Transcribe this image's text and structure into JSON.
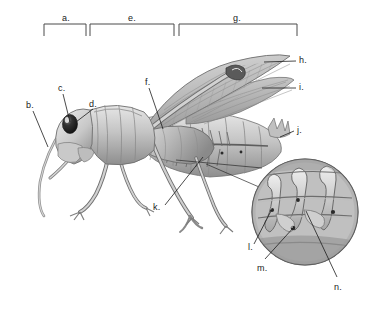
{
  "figure": {
    "background_color": "#ffffff",
    "ink_color": "#1a1a1a",
    "body_fill_light": "#d8d8d8",
    "body_fill_mid": "#b0b0b0",
    "body_fill_dark": "#7a7a7a",
    "body_fill_darkest": "#4a4a4a"
  },
  "brackets": [
    {
      "id": "bracket-a",
      "label": "a.",
      "x1": 44,
      "x2": 86,
      "label_x": 62,
      "label_y": 14
    },
    {
      "id": "bracket-e",
      "label": "e.",
      "x1": 90,
      "x2": 174,
      "label_x": 128,
      "label_y": 14
    },
    {
      "id": "bracket-g",
      "label": "g.",
      "x1": 179,
      "x2": 297,
      "label_x": 233,
      "label_y": 14
    }
  ],
  "labels": [
    {
      "id": "label-a",
      "text": "a.",
      "x": 62,
      "y": 14
    },
    {
      "id": "label-b",
      "text": "b.",
      "x": 26,
      "y": 101
    },
    {
      "id": "label-c",
      "text": "c.",
      "x": 58,
      "y": 84
    },
    {
      "id": "label-d",
      "text": "d.",
      "x": 89,
      "y": 100
    },
    {
      "id": "label-e",
      "text": "e.",
      "x": 128,
      "y": 14
    },
    {
      "id": "label-f",
      "text": "f.",
      "x": 145,
      "y": 78
    },
    {
      "id": "label-g",
      "text": "g.",
      "x": 233,
      "y": 14
    },
    {
      "id": "label-h",
      "text": "h.",
      "x": 299,
      "y": 56
    },
    {
      "id": "label-i",
      "text": "i.",
      "x": 299,
      "y": 83
    },
    {
      "id": "label-j",
      "text": "j.",
      "x": 297,
      "y": 126
    },
    {
      "id": "label-k",
      "text": "k.",
      "x": 153,
      "y": 203
    },
    {
      "id": "label-l",
      "text": "l.",
      "x": 248,
      "y": 243
    },
    {
      "id": "label-m",
      "text": "m.",
      "x": 257,
      "y": 264
    },
    {
      "id": "label-n",
      "text": "n.",
      "x": 334,
      "y": 283
    }
  ],
  "leader_lines": [
    {
      "id": "leader-b",
      "from": [
        33,
        110
      ],
      "to": [
        47,
        146
      ]
    },
    {
      "id": "leader-c",
      "from": [
        63,
        93
      ],
      "to": [
        71,
        125
      ]
    },
    {
      "id": "leader-d",
      "from": [
        92,
        108
      ],
      "to": [
        74,
        122
      ]
    },
    {
      "id": "leader-f",
      "from": [
        149,
        87
      ],
      "to": [
        163,
        129
      ]
    },
    {
      "id": "leader-h",
      "from": [
        296,
        61
      ],
      "to": [
        266,
        61
      ]
    },
    {
      "id": "leader-i",
      "from": [
        296,
        88
      ],
      "to": [
        264,
        88
      ]
    },
    {
      "id": "leader-j",
      "from": [
        295,
        131
      ],
      "to": [
        280,
        137
      ]
    },
    {
      "id": "leader-k",
      "from": [
        164,
        205
      ],
      "to": [
        202,
        158
      ]
    },
    {
      "id": "leader-l",
      "from": [
        254,
        243
      ],
      "to": [
        272,
        210
      ]
    },
    {
      "id": "leader-m",
      "from": [
        264,
        258
      ],
      "to": [
        293,
        222
      ]
    },
    {
      "id": "leader-n",
      "from": [
        336,
        277
      ],
      "to": [
        306,
        212
      ]
    },
    {
      "id": "leader-inset-top",
      "from": [
        175,
        160
      ],
      "to": [
        262,
        168
      ]
    },
    {
      "id": "leader-inset-mid",
      "from": [
        205,
        163
      ],
      "to": [
        266,
        188
      ]
    }
  ],
  "inset": {
    "id": "magnified-inset",
    "center_x": 305,
    "center_y": 212,
    "radius": 54,
    "description": "Circular magnified view of spiracle and tracheal tubes"
  },
  "specimen": {
    "name": "grasshopper",
    "orientation": "left-facing lateral view",
    "parts": [
      "head",
      "antenna",
      "compound eye",
      "pronotum",
      "thorax",
      "forewing",
      "hindwing",
      "abdomen",
      "cerci",
      "foreleg",
      "midleg",
      "hindleg femur",
      "tibia",
      "tarsus",
      "spiracle"
    ]
  }
}
